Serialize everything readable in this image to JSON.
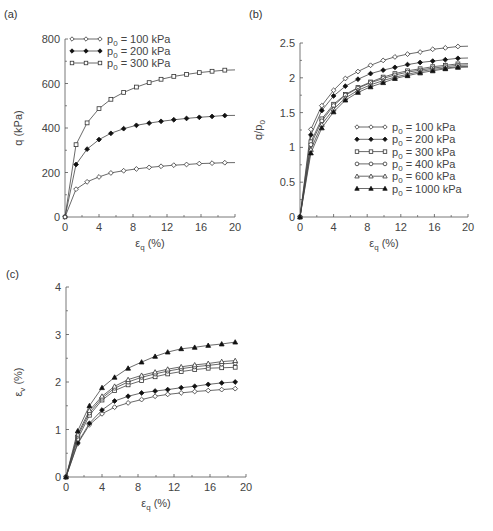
{
  "chart_data": [
    {
      "panel": "(a)",
      "type": "line",
      "title": "",
      "xlabel": "ε_q (%)",
      "ylabel": "q (kPa)",
      "xlim": [
        0,
        20
      ],
      "ylim": [
        0,
        800
      ],
      "xticks": [
        0,
        4,
        8,
        12,
        16,
        20
      ],
      "yticks": [
        0,
        200,
        400,
        600,
        800
      ],
      "grid": false,
      "legend_position": "upper left",
      "x": [
        0,
        1.3,
        2.6,
        4.0,
        5.4,
        6.9,
        8.4,
        9.9,
        11.3,
        12.8,
        14.3,
        15.8,
        17.3,
        18.8
      ],
      "series": [
        {
          "name": "p0 = 100 kPa",
          "marker": "diamond-open",
          "values": [
            0,
            125,
            158,
            180,
            198,
            208,
            216,
            223,
            228,
            233,
            236,
            240,
            242,
            244
          ]
        },
        {
          "name": "p0 = 200 kPa",
          "marker": "diamond-filled",
          "values": [
            0,
            236,
            305,
            348,
            376,
            397,
            412,
            422,
            430,
            437,
            443,
            448,
            452,
            456
          ]
        },
        {
          "name": "p0 = 300 kPa",
          "marker": "square-open",
          "values": [
            0,
            325,
            423,
            487,
            529,
            560,
            584,
            604,
            619,
            632,
            641,
            649,
            655,
            660
          ]
        }
      ]
    },
    {
      "panel": "(b)",
      "type": "line",
      "title": "",
      "xlabel": "ε_q (%)",
      "ylabel": "q/p0",
      "xlim": [
        0,
        20
      ],
      "ylim": [
        0,
        2.5
      ],
      "xticks": [
        0,
        4,
        8,
        12,
        16,
        20
      ],
      "yticks": [
        0,
        0.5,
        1,
        1.5,
        2,
        2.5
      ],
      "grid": false,
      "legend_position": "lower right",
      "x": [
        0,
        1.3,
        2.6,
        4.0,
        5.4,
        6.9,
        8.4,
        9.9,
        11.3,
        12.8,
        14.3,
        15.8,
        17.3,
        18.8
      ],
      "series": [
        {
          "name": "p0 = 100 kPa",
          "marker": "diamond-open",
          "values": [
            0,
            1.26,
            1.6,
            1.82,
            1.99,
            2.09,
            2.18,
            2.25,
            2.3,
            2.34,
            2.37,
            2.41,
            2.43,
            2.45
          ]
        },
        {
          "name": "p0 = 200 kPa",
          "marker": "diamond-filled",
          "values": [
            0,
            1.18,
            1.53,
            1.74,
            1.88,
            1.98,
            2.06,
            2.11,
            2.15,
            2.19,
            2.22,
            2.24,
            2.26,
            2.28
          ]
        },
        {
          "name": "p0 = 300 kPa",
          "marker": "square-open",
          "values": [
            0,
            1.08,
            1.41,
            1.62,
            1.76,
            1.86,
            1.94,
            2.01,
            2.06,
            2.1,
            2.13,
            2.16,
            2.18,
            2.2
          ]
        },
        {
          "name": "p0 = 400 kPa",
          "marker": "circle-open",
          "values": [
            0,
            1.04,
            1.38,
            1.6,
            1.75,
            1.85,
            1.93,
            1.99,
            2.04,
            2.08,
            2.11,
            2.14,
            2.16,
            2.18
          ]
        },
        {
          "name": "p0 = 600 kPa",
          "marker": "triangle-open",
          "values": [
            0,
            0.97,
            1.33,
            1.55,
            1.71,
            1.82,
            1.9,
            1.96,
            2.01,
            2.05,
            2.09,
            2.12,
            2.14,
            2.16
          ]
        },
        {
          "name": "p0 = 1000 kPa",
          "marker": "triangle-filled",
          "values": [
            0,
            0.92,
            1.28,
            1.51,
            1.68,
            1.79,
            1.87,
            1.93,
            1.99,
            2.03,
            2.07,
            2.1,
            2.13,
            2.15
          ]
        }
      ]
    },
    {
      "panel": "(c)",
      "type": "line",
      "title": "",
      "xlabel": "ε_q (%)",
      "ylabel": "ε_v (%)",
      "xlim": [
        0,
        20
      ],
      "ylim": [
        0,
        4
      ],
      "xticks": [
        0,
        4,
        8,
        12,
        16,
        20
      ],
      "yticks": [
        0,
        1,
        2,
        3,
        4
      ],
      "grid": false,
      "legend_position": "none (shared with panel b)",
      "x": [
        0,
        1.3,
        2.6,
        4.0,
        5.4,
        6.9,
        8.4,
        9.9,
        11.3,
        12.8,
        14.3,
        15.8,
        17.3,
        18.8
      ],
      "series": [
        {
          "name": "p0 = 100 kPa",
          "marker": "diamond-open",
          "values": [
            0,
            0.7,
            1.1,
            1.33,
            1.47,
            1.56,
            1.63,
            1.7,
            1.74,
            1.77,
            1.8,
            1.82,
            1.84,
            1.86
          ]
        },
        {
          "name": "p0 = 200 kPa",
          "marker": "diamond-filled",
          "values": [
            0,
            0.72,
            1.13,
            1.41,
            1.6,
            1.7,
            1.77,
            1.81,
            1.84,
            1.88,
            1.91,
            1.95,
            1.98,
            2.0
          ]
        },
        {
          "name": "p0 = 300 kPa",
          "marker": "square-open",
          "values": [
            0,
            0.8,
            1.3,
            1.62,
            1.82,
            1.94,
            2.03,
            2.11,
            2.17,
            2.22,
            2.26,
            2.29,
            2.3,
            2.31
          ]
        },
        {
          "name": "p0 = 400 kPa",
          "marker": "circle-open",
          "values": [
            0,
            0.86,
            1.35,
            1.66,
            1.87,
            2.0,
            2.1,
            2.17,
            2.23,
            2.28,
            2.32,
            2.35,
            2.38,
            2.4
          ]
        },
        {
          "name": "p0 = 600 kPa",
          "marker": "triangle-open",
          "values": [
            0,
            0.9,
            1.4,
            1.7,
            1.91,
            2.05,
            2.14,
            2.21,
            2.27,
            2.32,
            2.36,
            2.39,
            2.43,
            2.45
          ]
        },
        {
          "name": "p0 = 1000 kPa",
          "marker": "triangle-filled",
          "values": [
            0,
            0.97,
            1.5,
            1.88,
            2.1,
            2.29,
            2.42,
            2.54,
            2.63,
            2.7,
            2.73,
            2.77,
            2.8,
            2.84
          ]
        }
      ]
    }
  ],
  "labels": {
    "panel_a": "(a)",
    "panel_b": "(b)",
    "panel_c": "(c)",
    "legend_a": [
      "p0 = 100 kPa",
      "p0 = 200 kPa",
      "p0 = 300 kPa"
    ],
    "legend_b": [
      "p0 = 100 kPa",
      "p0 = 200 kPa",
      "p0 = 300 kPa",
      "p0 = 400 kPa",
      "p0 = 600 kPa",
      "p0 = 1000 kPa"
    ]
  }
}
